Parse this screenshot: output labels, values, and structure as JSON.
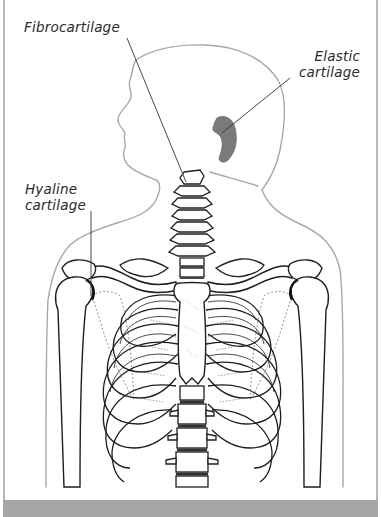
{
  "figure": {
    "labels": {
      "fibrocartilage": "Fibrocartilage",
      "elastic_line1": "Elastic",
      "elastic_line2": "cartilage",
      "hyaline_line1": "Hyaline",
      "hyaline_line2": "cartilage"
    },
    "colors": {
      "outline_body": "#a8a8a8",
      "outline_bone": "#1e1e1e",
      "elastic_fill": "#7a7a7a",
      "leader_line": "#333333",
      "frame_border": "#b9b9b9",
      "bottom_bar": "#a6a6a6",
      "background": "#ffffff"
    },
    "structures": [
      "head-silhouette",
      "ear-elastic-cartilage",
      "cervical-vertebrae",
      "clavicles",
      "scapulae",
      "humeri",
      "sternum",
      "rib-cage",
      "thoracic-vertebrae"
    ]
  }
}
